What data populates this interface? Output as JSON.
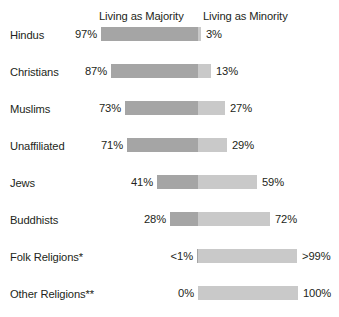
{
  "chart_data": {
    "type": "bar",
    "title": "",
    "subtitle": "",
    "xlabel": "",
    "ylabel": "",
    "orientation": "horizontal",
    "stacked": true,
    "grid": false,
    "legend_position": "top",
    "xlim": [
      0,
      100
    ],
    "categories": [
      "Hindus",
      "Christians",
      "Muslims",
      "Unaffiliated",
      "Jews",
      "Buddhists",
      "Folk Religions*",
      "Other Religions**"
    ],
    "series": [
      {
        "name": "Living as Majority",
        "color": "#a5a5a5",
        "values": [
          97,
          87,
          73,
          71,
          41,
          28,
          0.5,
          0
        ],
        "labels": [
          "97%",
          "87%",
          "73%",
          "71%",
          "41%",
          "28%",
          "<1%",
          "0%"
        ]
      },
      {
        "name": "Living as Minority",
        "color": "#c9c9c9",
        "values": [
          3,
          13,
          27,
          29,
          59,
          72,
          99.5,
          100
        ],
        "labels": [
          "3%",
          "13%",
          "27%",
          "29%",
          "59%",
          "72%",
          ">99%",
          "100%"
        ]
      }
    ]
  },
  "headers": {
    "majority": "Living as Majority",
    "minority": "Living as Minority"
  },
  "colors": {
    "majority": "#a5a5a5",
    "minority": "#c9c9c9",
    "text": "#231f20",
    "background": "#ffffff"
  }
}
